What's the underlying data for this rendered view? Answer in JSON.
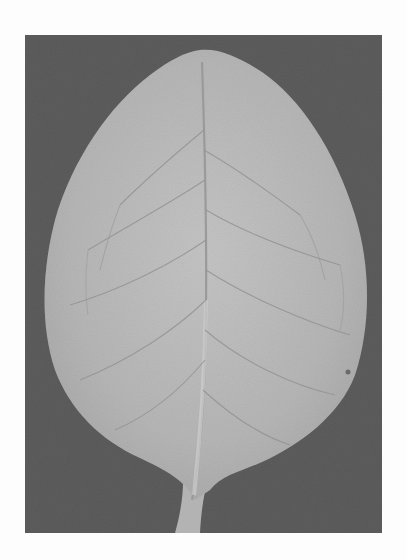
{
  "image": {
    "subject": "leaf",
    "description": "Grayscale photograph of a single ovate leaf with petiole on a dark gray background",
    "colors": {
      "page_background": "#fdfdfd",
      "photo_background": "#5c5c5c",
      "leaf": "#b9b9b9",
      "leaf_highlight": "#cdcdcd",
      "veins": "#8f8f8f",
      "midrib": "#c8c8c8"
    }
  }
}
